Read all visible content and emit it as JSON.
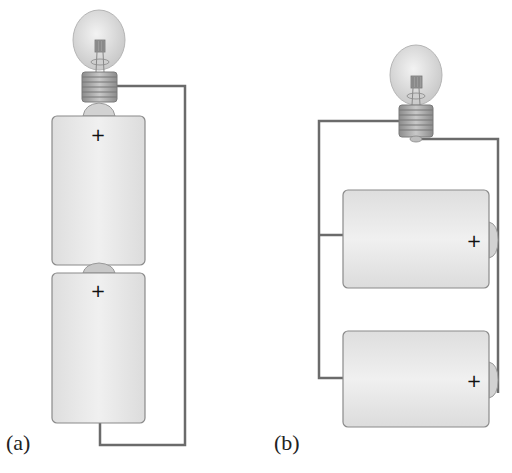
{
  "figure": {
    "panels": [
      {
        "id": "a",
        "label": "(a)",
        "arrangement": "series",
        "batteries": [
          {
            "terminal_label": "+"
          },
          {
            "terminal_label": "+"
          }
        ],
        "bulb": "light-bulb"
      },
      {
        "id": "b",
        "label": "(b)",
        "arrangement": "parallel",
        "batteries": [
          {
            "terminal_label": "+"
          },
          {
            "terminal_label": "+"
          }
        ],
        "bulb": "light-bulb"
      }
    ],
    "colors": {
      "wire": "#6b6b6b",
      "battery_fill": "#e6e6e6",
      "battery_outline": "#8a8a8a",
      "bulb_glass": "#dcdcdc",
      "bulb_base": "#9a9a9a"
    }
  }
}
